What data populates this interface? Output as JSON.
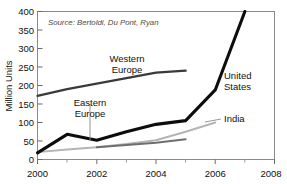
{
  "chart_data": {
    "type": "line",
    "title": "",
    "xlabel": "",
    "ylabel": "Million Units",
    "xlim": [
      2000,
      2008
    ],
    "ylim": [
      0,
      400
    ],
    "grid": false,
    "legend_position": "inline-labels",
    "x_ticks": [
      "2000",
      "2002",
      "2004",
      "2006",
      "2008"
    ],
    "x_tick_values": [
      2000,
      2002,
      2004,
      2006,
      2008
    ],
    "x_minor_tick_values": [
      2001,
      2003,
      2005,
      2007
    ],
    "y_ticks": [
      "0",
      "50",
      "100",
      "150",
      "200",
      "250",
      "300",
      "350",
      "400"
    ],
    "y_tick_values": [
      0,
      50,
      100,
      150,
      200,
      250,
      300,
      350,
      400
    ],
    "annotations": [
      {
        "name": "source-note",
        "text": "Source: Bertoldi, Du Pont, Ryan"
      }
    ],
    "series": [
      {
        "name": "United States",
        "color": "#0d0d0d",
        "x": [
          2000,
          2001,
          2002,
          2003,
          2004,
          2005,
          2006,
          2007
        ],
        "values": [
          18,
          68,
          52,
          75,
          95,
          105,
          188,
          400
        ]
      },
      {
        "name": "Western Europe",
        "color": "#3a3a3a",
        "x": [
          2000,
          2001,
          2002,
          2003,
          2004,
          2005
        ],
        "values": [
          172,
          190,
          205,
          220,
          235,
          240
        ]
      },
      {
        "name": "Eastern Europe",
        "color": "#6e6e6e",
        "x": [
          2002,
          2003,
          2004,
          2005
        ],
        "values": [
          33,
          39,
          45,
          55
        ]
      },
      {
        "name": "India",
        "color": "#b4b4b4",
        "x": [
          2000,
          2001,
          2002,
          2003,
          2004,
          2005,
          2006
        ],
        "values": [
          20,
          27,
          33,
          42,
          52,
          75,
          100
        ]
      }
    ]
  },
  "labels": {
    "y_axis_title": "Million Units",
    "series_western_europe_line1": "Western",
    "series_western_europe_line2": "Europe",
    "series_eastern_europe_line1": "Eastern",
    "series_eastern_europe_line2": "Europe",
    "series_united_states_line1": "United",
    "series_united_states_line2": "States",
    "series_india": "India",
    "source": "Source: Bertoldi, Du Pont, Ryan",
    "y_0": "0",
    "y_50": "50",
    "y_100": "100",
    "y_150": "150",
    "y_200": "200",
    "y_250": "250",
    "y_300": "300",
    "y_350": "350",
    "y_400": "400",
    "x_2000": "2000",
    "x_2002": "2002",
    "x_2004": "2004",
    "x_2006": "2006",
    "x_2008": "2008"
  },
  "top_crop": {
    "partial_title": ""
  }
}
